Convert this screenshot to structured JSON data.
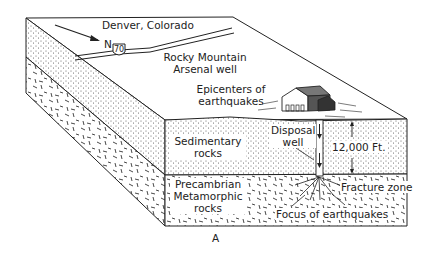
{
  "diagram": {
    "type": "geologic-block-diagram",
    "figure_label": "A",
    "colors": {
      "ink": "#222222",
      "paper": "#ffffff"
    },
    "surface_labels": {
      "city": "Denver, Colorado",
      "north": "N",
      "highway_shield": "70",
      "well_site_line1": "Rocky Mountain",
      "well_site_line2": "Arsenal well",
      "epicenters_line1": "Epicenters of",
      "epicenters_line2": "earthquakes"
    },
    "layers": [
      {
        "name": "sedimentary",
        "label_line1": "Sedimentary",
        "label_line2": "rocks",
        "pattern": "stipple"
      },
      {
        "name": "precambrian",
        "label_line1": "Precambrian",
        "label_line2": "Metamorphic",
        "label_line3": "rocks",
        "pattern": "dashes"
      }
    ],
    "well": {
      "label_line1": "Disposal",
      "label_line2": "well",
      "depth": "12,000 Ft."
    },
    "subsurface_labels": {
      "fracture": "Fracture zone",
      "focus": "Focus of earthquakes"
    }
  }
}
